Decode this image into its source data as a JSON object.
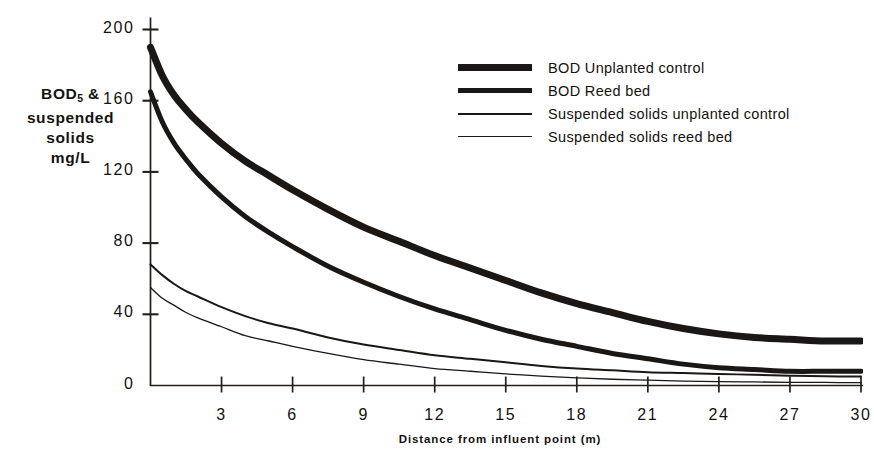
{
  "chart_data": {
    "type": "line",
    "title": "",
    "xlabel": "Distance from influent point (m)",
    "ylabel": "BOD5 & suspended solids mg/L",
    "ylabel_lines": [
      "BOD",
      "5",
      " &",
      "suspended",
      "solids",
      "mg/L"
    ],
    "xlim": [
      0,
      30
    ],
    "ylim": [
      0,
      200
    ],
    "xticks": [
      3,
      6,
      9,
      12,
      15,
      18,
      21,
      24,
      27,
      30
    ],
    "xtick_labels": [
      "3",
      "6",
      "9",
      "12",
      "15",
      "18",
      "21",
      "24",
      "27",
      "30"
    ],
    "yticks": [
      0,
      40,
      80,
      120,
      160,
      200
    ],
    "ytick_labels": [
      "0",
      "40",
      "80",
      "120",
      "160",
      "200"
    ],
    "grid": false,
    "legend_position": "upper right",
    "x": [
      0,
      0.5,
      1,
      1.5,
      2,
      3,
      4,
      5,
      6,
      7.5,
      9,
      10.5,
      12,
      13.5,
      15,
      16.5,
      18,
      19.5,
      21,
      22.5,
      24,
      25.5,
      27,
      28.5,
      30
    ],
    "series": [
      {
        "name": "BOD  Unplanted control",
        "key": "bod_unplanted_control",
        "line_width": 7,
        "color": "#1a1714",
        "values": [
          190,
          174,
          163,
          155,
          148,
          136,
          126,
          118,
          110,
          99,
          89,
          81,
          73,
          66,
          59,
          52,
          46,
          41,
          36,
          32,
          29,
          27,
          26,
          25,
          25
        ]
      },
      {
        "name": "BOD  Reed bed",
        "key": "bod_reed_bed",
        "line_width": 5,
        "color": "#1a1714",
        "values": [
          165,
          148,
          136,
          127,
          119,
          106,
          95,
          86,
          78,
          67,
          58,
          50,
          43,
          37,
          31,
          26,
          22,
          18,
          15,
          12,
          10,
          9,
          8,
          8,
          8
        ]
      },
      {
        "name": "Suspended solids unplanted control",
        "key": "ss_unplanted_control",
        "line_width": 2,
        "color": "#1a1714",
        "values": [
          68,
          62,
          57,
          53,
          50,
          44,
          39,
          35,
          32,
          27,
          23,
          20,
          17,
          15,
          13,
          11,
          9.5,
          8.5,
          7.5,
          7,
          6.5,
          6,
          5.5,
          5.2,
          5
        ]
      },
      {
        "name": "Suspended solids reed bed",
        "key": "ss_reed_bed",
        "line_width": 1.3,
        "color": "#1a1714",
        "values": [
          55,
          49,
          45,
          41,
          38,
          33,
          28,
          25,
          22,
          18,
          14.5,
          12,
          9.5,
          8,
          6.5,
          5.3,
          4.3,
          3.5,
          3,
          2.5,
          2.2,
          2,
          1.8,
          1.7,
          1.6
        ]
      }
    ],
    "legend": [
      {
        "label": "BOD  Unplanted control",
        "swatch_height": 7
      },
      {
        "label": "BOD  Reed bed",
        "swatch_height": 5
      },
      {
        "label": "Suspended solids unplanted control",
        "swatch_height": 2
      },
      {
        "label": "Suspended solids reed bed",
        "swatch_height": 1.4
      }
    ]
  },
  "axis_title": {
    "y_line1": "BOD",
    "y_sub": "5",
    "y_line1_tail": " &",
    "y_line2": "suspended",
    "y_line3": "solids",
    "y_line4": "mg/L",
    "x_title": "Distance from influent point (m)"
  },
  "colors": {
    "ink": "#1a1714",
    "axis": "#241f1b",
    "background": "#ffffff"
  }
}
